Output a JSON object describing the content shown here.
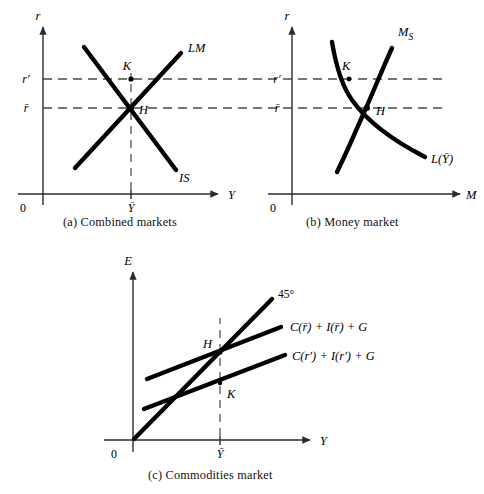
{
  "figure": {
    "title_implicit": "IS-LM three panel diagram",
    "panels": [
      {
        "id": "a",
        "caption": "(a)  Combined markets",
        "x_axis_label": "Y",
        "y_axis_label": "r",
        "origin_label": "0",
        "x_tick_label": "Ȳ",
        "y_tick_labels": [
          "r′",
          "r̄"
        ],
        "curves": [
          {
            "name": "LM",
            "label": "LM",
            "shape": "upward-sloping-line"
          },
          {
            "name": "IS",
            "label": "IS",
            "shape": "downward-sloping-line"
          }
        ],
        "points": [
          {
            "label": "K",
            "x_value": "Ȳ",
            "y_value": "r′"
          },
          {
            "label": "H",
            "x_value": "Ȳ",
            "y_value": "r̄"
          }
        ]
      },
      {
        "id": "b",
        "caption": "(b)  Money market",
        "x_axis_label": "M",
        "y_axis_label": "r",
        "origin_label": "0",
        "y_tick_labels": [
          "r′",
          "r̄"
        ],
        "curves": [
          {
            "name": "money-supply",
            "label": "M_S",
            "label_base": "M",
            "label_sub": "S",
            "shape": "upward-sloping-curve"
          },
          {
            "name": "liquidity-preference",
            "label": "L(Ȳ)",
            "shape": "downward-sloping-convex-curve"
          }
        ],
        "points": [
          {
            "label": "K",
            "y_value": "r′"
          },
          {
            "label": "H",
            "y_value": "r̄"
          }
        ]
      },
      {
        "id": "c",
        "caption": "(c)  Commodities market",
        "x_axis_label": "Y",
        "y_axis_label": "E",
        "origin_label": "0",
        "x_tick_label": "Ȳ",
        "curves": [
          {
            "name": "forty-five-degree-line",
            "label": "45°",
            "shape": "ray-from-origin"
          },
          {
            "name": "expenditure-rbar",
            "label": "C(r̄) + I(r̄) + G",
            "shape": "upward-sloping-line"
          },
          {
            "name": "expenditure-rprime",
            "label": "C(r′) + I(r′) + G",
            "shape": "upward-sloping-line"
          }
        ],
        "points": [
          {
            "label": "H",
            "x_value": "Ȳ"
          },
          {
            "label": "K",
            "x_value": "Ȳ"
          }
        ]
      }
    ],
    "colors": {
      "curve": "#000000",
      "axis": "#2b2b2b",
      "dashed": "#4a4a4a",
      "background": "#ffffff"
    }
  }
}
